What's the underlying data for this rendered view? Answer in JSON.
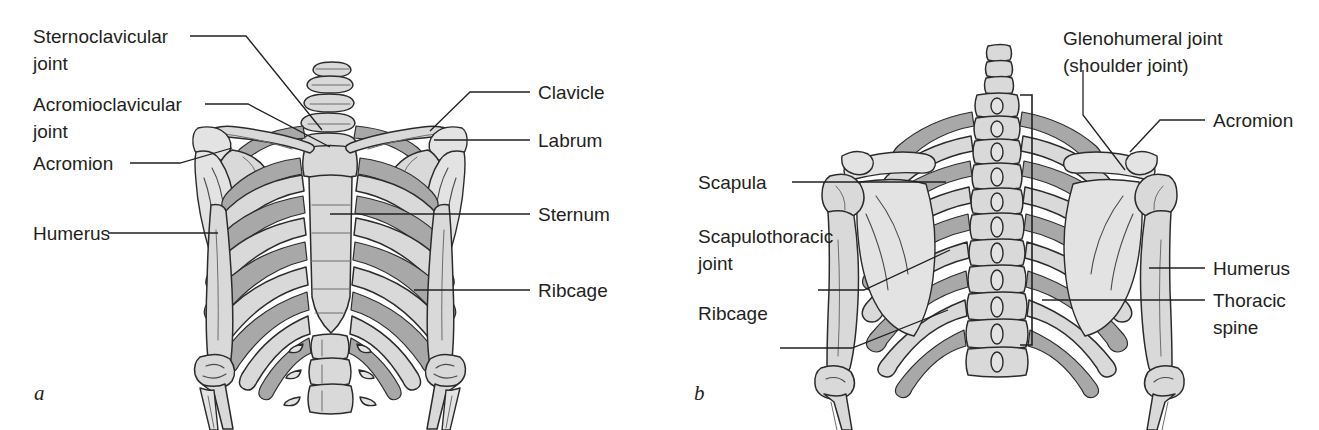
{
  "figure": {
    "background_color": "#ffffff",
    "line_color": "#231f20",
    "bone_fill": "#d9d9d9",
    "bone_shade": "#a8a8a8"
  },
  "panels": [
    {
      "id": "a",
      "caption": "a",
      "view": "anterior",
      "labels": [
        {
          "id": "sternoclavicular-joint",
          "line1": "Sternoclavicular",
          "line2": "joint"
        },
        {
          "id": "acromioclavicular-joint",
          "line1": "Acromioclavicular",
          "line2": "joint"
        },
        {
          "id": "acromion",
          "line1": "Acromion",
          "line2": ""
        },
        {
          "id": "humerus",
          "line1": "Humerus",
          "line2": ""
        },
        {
          "id": "clavicle",
          "line1": "Clavicle",
          "line2": ""
        },
        {
          "id": "labrum",
          "line1": "Labrum",
          "line2": ""
        },
        {
          "id": "sternum",
          "line1": "Sternum",
          "line2": ""
        },
        {
          "id": "ribcage",
          "line1": "Ribcage",
          "line2": ""
        }
      ]
    },
    {
      "id": "b",
      "caption": "b",
      "view": "posterior",
      "labels": [
        {
          "id": "scapula",
          "line1": "Scapula",
          "line2": ""
        },
        {
          "id": "scapulothoracic-joint",
          "line1": "Scapulothoracic",
          "line2": "joint"
        },
        {
          "id": "ribcage",
          "line1": "Ribcage",
          "line2": ""
        },
        {
          "id": "glenohumeral-joint",
          "line1": "Glenohumeral joint",
          "line2": "(shoulder joint)"
        },
        {
          "id": "acromion",
          "line1": "Acromion",
          "line2": ""
        },
        {
          "id": "humerus",
          "line1": "Humerus",
          "line2": ""
        },
        {
          "id": "thoracic-spine",
          "line1": "Thoracic",
          "line2": "spine"
        }
      ]
    }
  ]
}
